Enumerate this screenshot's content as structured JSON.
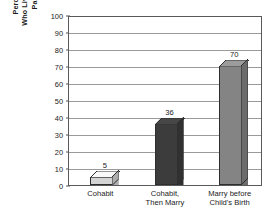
{
  "chart_data": {
    "type": "bar",
    "title": "",
    "subtitle": "",
    "categories": [
      "Cohabit",
      "Cohabit, Then Marry",
      "Marry before Child's Birth"
    ],
    "category_lines": [
      [
        "Cohabit"
      ],
      [
        "Cohabit,",
        "Then Marry"
      ],
      [
        "Marry before",
        "Child's Birth"
      ]
    ],
    "values": [
      5,
      36,
      70
    ],
    "value_labels": [
      "5",
      "36",
      "70"
    ],
    "bar_colors": [
      "#d4d4d4",
      "#3c3c3c",
      "#848484"
    ],
    "xlabel": "",
    "ylabel": "Percentage of Children Who Live with Two Biological Parents until Age 18",
    "ylabel_lines": [
      "Percentage of Children",
      "Who Live with Two Biological",
      "Parents until Age 18"
    ],
    "ylim": [
      0,
      100
    ],
    "ytick_step": 10,
    "yticks": [
      0,
      10,
      20,
      30,
      40,
      50,
      60,
      70,
      80,
      90,
      100
    ],
    "ytick_labels": [
      "0",
      "10",
      "20",
      "30",
      "40",
      "50",
      "60",
      "70",
      "80",
      "90",
      "100"
    ],
    "grid": true,
    "grid_axis": "y",
    "legend": false,
    "legend_position": "none",
    "plot_background": "#ffffff",
    "gridline_color": "#9a9a9a",
    "axis_color": "#5a5a5a",
    "text_color": "#1a1a1a"
  }
}
